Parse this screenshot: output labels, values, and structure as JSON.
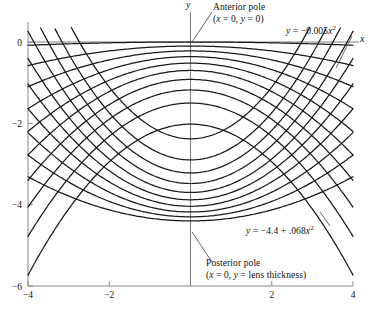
{
  "figure": {
    "axis_labels": {
      "x": "x",
      "y": "y"
    },
    "annotations": {
      "anterior_pole_line1": "Anterior pole",
      "anterior_pole_line2_pre": "(",
      "anterior_pole_line2": "x = 0, y = 0)",
      "posterior_pole_line1": "Posterior pole",
      "posterior_pole_line2": "(x = 0, y = lens thickness)",
      "equation_anterior": "y = −0.005x",
      "equation_anterior_exp": "2",
      "equation_posterior": "y = −4.4 + .068x",
      "equation_posterior_exp": "2"
    },
    "tick_labels": {
      "x": [
        "−4",
        "−2",
        "2",
        "4"
      ],
      "y": [
        "0",
        "−2",
        "−4",
        "−6"
      ]
    },
    "colors": {
      "curve": "#1a1a1a",
      "axis": "#808080",
      "frame": "#8a8a8a",
      "leader": "#555555",
      "background": "#ffffff"
    }
  },
  "chart_data": {
    "type": "line",
    "title": "",
    "xlabel": "x",
    "ylabel": "y",
    "xlim": [
      -4,
      4
    ],
    "ylim": [
      -6,
      0
    ],
    "grid": false,
    "legend": null,
    "xticks": [
      -4,
      -2,
      2,
      4
    ],
    "yticks": [
      0,
      -2,
      -4,
      -6
    ],
    "curve_families": [
      {
        "name": "anterior surfaces",
        "form": "y = vertex - a*x^2",
        "opens": "down",
        "labeled_equation": "y = -0.005x^2",
        "series": [
          {
            "name": "anterior-1",
            "vertex": 0.0,
            "a": 0.005
          },
          {
            "name": "anterior-2",
            "vertex": -0.1,
            "a": 0.03
          },
          {
            "name": "anterior-3",
            "vertex": -0.22,
            "a": 0.055
          },
          {
            "name": "anterior-4",
            "vertex": -0.36,
            "a": 0.08
          },
          {
            "name": "anterior-5",
            "vertex": -0.52,
            "a": 0.105
          },
          {
            "name": "anterior-6",
            "vertex": -0.7,
            "a": 0.13
          },
          {
            "name": "anterior-7",
            "vertex": -0.92,
            "a": 0.155
          },
          {
            "name": "anterior-8",
            "vertex": -1.18,
            "a": 0.18
          },
          {
            "name": "anterior-9",
            "vertex": -1.5,
            "a": 0.205
          },
          {
            "name": "anterior-10",
            "vertex": -2.02,
            "a": 0.232
          }
        ]
      },
      {
        "name": "posterior surfaces",
        "form": "y = vertex + a*x^2",
        "opens": "up",
        "labeled_equation": "y = -4.4 + .068x^2",
        "series": [
          {
            "name": "posterior-1",
            "vertex": -4.4,
            "a": 0.068
          },
          {
            "name": "posterior-2",
            "vertex": -4.3,
            "a": 0.095
          },
          {
            "name": "posterior-3",
            "vertex": -4.18,
            "a": 0.122
          },
          {
            "name": "posterior-4",
            "vertex": -4.04,
            "a": 0.15
          },
          {
            "name": "posterior-5",
            "vertex": -3.88,
            "a": 0.178
          },
          {
            "name": "posterior-6",
            "vertex": -3.7,
            "a": 0.206
          },
          {
            "name": "posterior-7",
            "vertex": -3.48,
            "a": 0.234
          },
          {
            "name": "posterior-8",
            "vertex": -3.22,
            "a": 0.262
          },
          {
            "name": "posterior-9",
            "vertex": -2.9,
            "a": 0.29
          },
          {
            "name": "posterior-10",
            "vertex": -2.38,
            "a": 0.318
          }
        ]
      }
    ],
    "annotated_points": [
      {
        "label": "Anterior pole",
        "x": 0,
        "y": 0
      },
      {
        "label": "Posterior pole",
        "x": 0,
        "y": "lens thickness"
      }
    ]
  }
}
